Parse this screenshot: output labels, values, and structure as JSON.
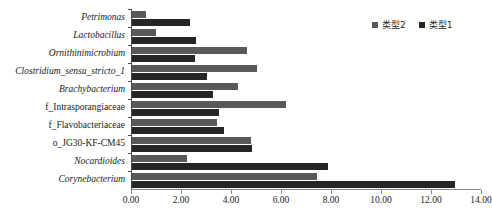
{
  "chart_data": {
    "type": "bar",
    "orientation": "horizontal",
    "title": "",
    "subtitle": "",
    "xlabel": "",
    "ylabel": "",
    "xlim": [
      0.0,
      14.0
    ],
    "xticks": [
      "0.00",
      "2.00",
      "4.00",
      "6.00",
      "8.00",
      "10.00",
      "12.00",
      "14.00"
    ],
    "xtick_values": [
      0.0,
      2.0,
      4.0,
      6.0,
      8.0,
      10.0,
      12.0,
      14.0
    ],
    "grid": false,
    "legend_position": "top-right",
    "categories": [
      "Petrimonas",
      "Lactobacillus",
      "Ornithinimicrobium",
      "Clostridium_sensu_stricto_1",
      "Brachybacterium",
      "f_Intrasporangiaceae",
      "f_Flavobacteriaceae",
      "o_JG30-KF-CM45",
      "Nocardioides",
      "Corynebacterium"
    ],
    "category_styles": [
      "italic",
      "italic",
      "italic",
      "italic",
      "italic",
      "normal",
      "normal",
      "normal",
      "italic",
      "italic"
    ],
    "series": [
      {
        "name": "类型2",
        "color": "#59595b",
        "values": [
          0.6,
          1.0,
          4.65,
          5.05,
          4.3,
          6.2,
          3.45,
          4.8,
          2.25,
          7.45
        ]
      },
      {
        "name": "类型1",
        "color": "#262626",
        "values": [
          2.35,
          2.6,
          2.55,
          3.05,
          3.3,
          3.55,
          3.75,
          4.85,
          7.9,
          13.0
        ]
      }
    ]
  },
  "legend": {
    "items": [
      {
        "label": "类型2",
        "color": "#59595b"
      },
      {
        "label": "类型1",
        "color": "#262626"
      }
    ]
  }
}
